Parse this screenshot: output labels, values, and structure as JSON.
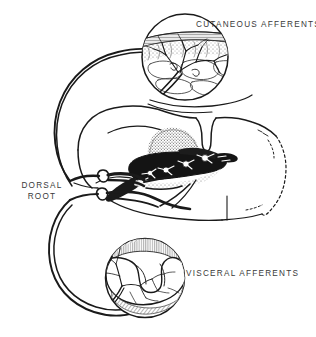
{
  "figure": {
    "background_color": "#ffffff",
    "ink_color": "#1a1a1a",
    "label_color": "#3a3a3a",
    "width": 316,
    "height": 337
  },
  "labels": {
    "cutaneous": "CUTANEOUS AFFERENTS",
    "visceral": "VISCERAL AFFERENTS",
    "dorsal_root_line1": "DORSAL",
    "dorsal_root_line2": "ROOT"
  },
  "insets": [
    {
      "id": "cutaneous-inset",
      "name": "skin-cross-section",
      "center_x": 185,
      "center_y": 57,
      "radius": 44,
      "contents": "skin epidermis layer with stippled dermis and branching free nerve endings"
    },
    {
      "id": "visceral-inset",
      "name": "viscus-cross-section",
      "center_x": 145,
      "center_y": 278,
      "radius": 40,
      "contents": "hollow visceral organ wall with hatched muscularis and branching nerve plexus"
    }
  ],
  "structures": {
    "spinal_cord": "transverse hemisection of spinal cord with dorsal median sulcus",
    "dorsal_horn": "darkly shaded dorsal horn gray matter with white neuron cell bodies",
    "substantia_gelatinosa": "stippled cap over dorsal horn",
    "dorsal_root_ganglia": "two oval ganglionic swellings on the dorsal root",
    "cut_edge": "dashed broken outline on right side indicating cut away segment"
  }
}
